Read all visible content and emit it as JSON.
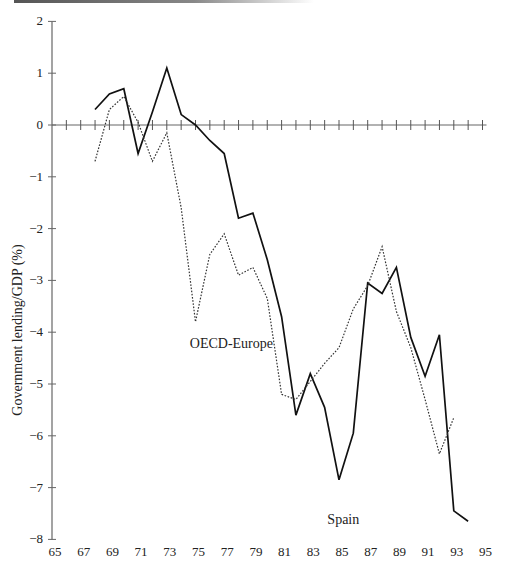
{
  "chart_data": {
    "type": "line",
    "title": "",
    "xlabel": "",
    "ylabel": "Government lending/GDP (%)",
    "xlim": [
      65,
      95
    ],
    "ylim": [
      -8,
      2
    ],
    "x_ticks": [
      "65",
      "67",
      "69",
      "71",
      "73",
      "75",
      "77",
      "79",
      "81",
      "83",
      "85",
      "87",
      "89",
      "91",
      "93",
      "95"
    ],
    "y_ticks": [
      "2",
      "1",
      "0",
      "−1",
      "−2",
      "−3",
      "−4",
      "−5",
      "−6",
      "−7",
      "−8"
    ],
    "grid": false,
    "legend": "inline annotations",
    "series": [
      {
        "name": "Spain",
        "style": "solid",
        "x": [
          68,
          69,
          70,
          71,
          72,
          73,
          74,
          75,
          76,
          77,
          78,
          79,
          80,
          81,
          82,
          83,
          84,
          85,
          86,
          87,
          88,
          89,
          90,
          91,
          92,
          93,
          94
        ],
        "values": [
          0.3,
          0.6,
          0.7,
          -0.55,
          0.25,
          1.1,
          0.2,
          0.0,
          -0.3,
          -0.55,
          -1.8,
          -1.7,
          -2.6,
          -3.7,
          -5.6,
          -4.8,
          -5.45,
          -6.85,
          -5.95,
          -3.05,
          -3.25,
          -2.75,
          -4.1,
          -4.85,
          -4.05,
          -7.45,
          -7.65
        ]
      },
      {
        "name": "OECD-Europe",
        "style": "dotted",
        "x": [
          68,
          69,
          70,
          71,
          72,
          73,
          74,
          75,
          76,
          77,
          78,
          79,
          80,
          81,
          82,
          83,
          84,
          85,
          86,
          87,
          88,
          89,
          90,
          91,
          92,
          93
        ],
        "values": [
          -0.7,
          0.3,
          0.55,
          0.05,
          -0.7,
          -0.15,
          -1.6,
          -3.8,
          -2.5,
          -2.1,
          -2.9,
          -2.75,
          -3.35,
          -5.2,
          -5.3,
          -4.95,
          -4.6,
          -4.3,
          -3.55,
          -3.1,
          -2.35,
          -3.6,
          -4.3,
          -5.3,
          -6.35,
          -5.65
        ]
      }
    ],
    "annotations": [
      {
        "text": "OECD-Europe",
        "x": 77.5,
        "y": -4.2
      },
      {
        "text": "Spain",
        "x": 85.3,
        "y": -7.6
      }
    ]
  }
}
